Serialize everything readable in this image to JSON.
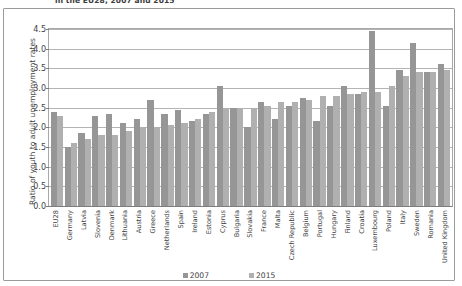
{
  "chart_title": "in the EU28, 2007 and 2015",
  "legend": {
    "position": "bottom-center",
    "entries": [
      {
        "label": "2007",
        "color": "#969696"
      },
      {
        "label": "2015",
        "color": "#b0b0b0"
      }
    ]
  },
  "colors": {
    "series_2007": "#969696",
    "series_2015": "#b0b0b0",
    "gridline": "#b4b4b4",
    "axis": "#7d7d7d",
    "frame_border": "#9b9b9b",
    "text": "#3f3f3f",
    "background": "#ffffff"
  },
  "chart_data": {
    "type": "bar",
    "title": "in the EU28, 2007 and 2015",
    "xlabel": "",
    "ylabel": "Ratio of youth to adult unemployment rates",
    "ylim": [
      0.0,
      4.5
    ],
    "ytick_step": 0.5,
    "yticks": [
      "0.0",
      "0.5",
      "1.0",
      "1.5",
      "2.0",
      "2.5",
      "3.0",
      "3.5",
      "4.0",
      "4.5"
    ],
    "grid": true,
    "legend_position": "bottom-center",
    "categories": [
      "EU28",
      "Germany",
      "Latvia",
      "Slovenia",
      "Denmark",
      "Lithuania",
      "Austria",
      "Greece",
      "Netherlands",
      "Spain",
      "Ireland",
      "Estonia",
      "Cyprus",
      "Bulgaria",
      "Slovakia",
      "France",
      "Malta",
      "Czech Republic",
      "Belgium",
      "Portugal",
      "Hungary",
      "Finland",
      "Croatia",
      "Luxembourg",
      "Poland",
      "Italy",
      "Sweden",
      "Romania",
      "United Kingdom"
    ],
    "series": [
      {
        "name": "2007",
        "color": "#969696",
        "values": [
          2.4,
          1.5,
          1.85,
          2.3,
          2.35,
          2.1,
          2.2,
          2.7,
          2.35,
          2.45,
          2.15,
          2.35,
          3.05,
          2.5,
          2.0,
          2.65,
          2.2,
          2.55,
          2.75,
          2.15,
          2.55,
          3.05,
          2.85,
          4.45,
          2.55,
          3.45,
          4.15,
          3.4,
          3.6
        ]
      },
      {
        "name": "2015",
        "color": "#b0b0b0",
        "values": [
          2.28,
          1.6,
          1.7,
          1.8,
          1.8,
          1.9,
          2.0,
          2.0,
          2.05,
          2.1,
          2.2,
          2.4,
          2.5,
          2.5,
          2.5,
          2.55,
          2.65,
          2.65,
          2.7,
          2.8,
          2.8,
          2.85,
          2.9,
          2.9,
          3.05,
          3.3,
          3.4,
          3.4,
          3.45
        ]
      }
    ]
  }
}
